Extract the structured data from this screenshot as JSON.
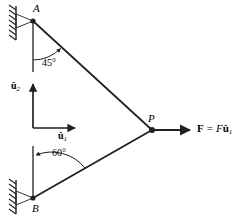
{
  "figure": {
    "background_color": "#ffffff",
    "line_color": "#231f20",
    "width": 243,
    "height": 224
  },
  "nodes": {
    "a": {
      "label": "A",
      "x": 33,
      "y": 21
    },
    "b": {
      "label": "B",
      "x": 33,
      "y": 198
    },
    "p": {
      "label": "P",
      "x": 152,
      "y": 130
    }
  },
  "members": [
    {
      "name": "member-ap",
      "from": "A",
      "to": "P"
    },
    {
      "name": "member-bp",
      "from": "B",
      "to": "P"
    }
  ],
  "supports": [
    {
      "name": "wall-support-a",
      "at": "A",
      "type": "hatched-wall"
    },
    {
      "name": "wall-support-b",
      "at": "B",
      "type": "hatched-wall"
    }
  ],
  "angles": [
    {
      "name": "angle-at-a",
      "label": "45°",
      "value": 45,
      "at": "A",
      "measured_from": "vertical"
    },
    {
      "name": "angle-at-b",
      "label": "60°",
      "value": 60,
      "at": "B",
      "measured_from": "vertical"
    }
  ],
  "unit_vectors": {
    "u1": {
      "base": "û",
      "subscript": "1",
      "direction": "horizontal-right"
    },
    "u2": {
      "base": "û",
      "subscript": "2",
      "direction": "vertical-up"
    }
  },
  "force": {
    "name": "applied-force",
    "symbol": "F",
    "equals": "=",
    "magnitude": "F",
    "unit_vector_base": "û",
    "unit_vector_subscript": "1",
    "direction": "horizontal-right",
    "at": "P"
  }
}
